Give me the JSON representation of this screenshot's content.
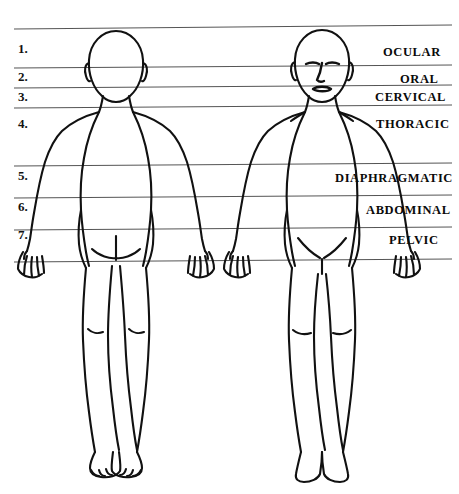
{
  "diagram": {
    "view_left": "posterior",
    "view_right": "anterior",
    "background_color": "#ffffff",
    "line_color": "#555555",
    "outline_color": "#111111"
  },
  "numbers": [
    {
      "text": "1.",
      "x": 18,
      "y": 42
    },
    {
      "text": "2.",
      "x": 18,
      "y": 70
    },
    {
      "text": "3.",
      "x": 18,
      "y": 90
    },
    {
      "text": "4.",
      "x": 18,
      "y": 117
    },
    {
      "text": "5.",
      "x": 18,
      "y": 169
    },
    {
      "text": "6.",
      "x": 18,
      "y": 200
    },
    {
      "text": "7.",
      "x": 18,
      "y": 228
    }
  ],
  "region_labels": [
    {
      "text": "OCULAR",
      "x": 383,
      "y": 46,
      "number": "1."
    },
    {
      "text": "ORAL",
      "x": 400,
      "y": 73,
      "number": "2."
    },
    {
      "text": "CERVICAL",
      "x": 375,
      "y": 91,
      "number": "3."
    },
    {
      "text": "THORACIC",
      "x": 376,
      "y": 118,
      "number": "4."
    },
    {
      "text": "DIAPHRAGMATIC",
      "x": 335,
      "y": 172,
      "number": "5."
    },
    {
      "text": "ABDOMINAL",
      "x": 366,
      "y": 204,
      "number": "6."
    },
    {
      "text": "PELVIC",
      "x": 389,
      "y": 234,
      "number": "7."
    }
  ],
  "guide_lines": [
    {
      "id": "line-top",
      "y_left": 29,
      "y_right": 25
    },
    {
      "id": "line-ocular",
      "y_left": 68,
      "y_right": 65
    },
    {
      "id": "line-oral",
      "y_left": 88,
      "y_right": 85
    },
    {
      "id": "line-cervical",
      "y_left": 108,
      "y_right": 105
    },
    {
      "id": "line-thoracic",
      "y_left": 166,
      "y_right": 163
    },
    {
      "id": "line-diaphragmatic",
      "y_left": 198,
      "y_right": 195
    },
    {
      "id": "line-abdominal",
      "y_left": 230,
      "y_right": 227
    },
    {
      "id": "line-pelvic",
      "y_left": 262,
      "y_right": 259
    }
  ]
}
